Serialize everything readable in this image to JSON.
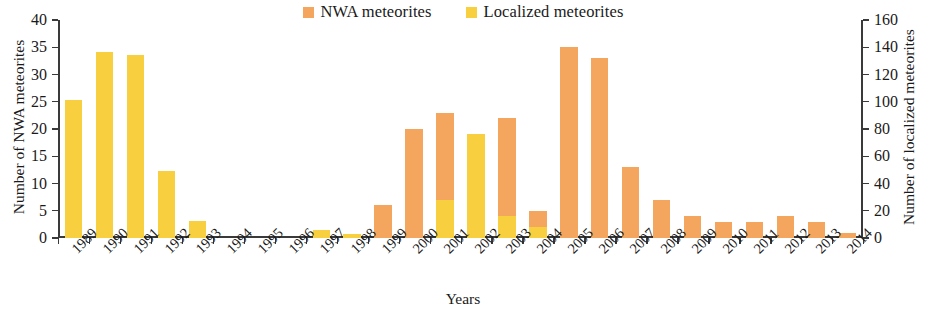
{
  "chart_data": {
    "type": "bar",
    "stacked": true,
    "title": "",
    "xlabel": "Years",
    "ylabel": "Number of NWA meteorites",
    "ylabel_secondary": "Number of localized meteorites",
    "ylim": [
      0,
      40
    ],
    "ylim_secondary": [
      0,
      160
    ],
    "yticks": [
      0,
      5,
      10,
      15,
      20,
      25,
      30,
      35,
      40
    ],
    "yticks_secondary": [
      0,
      20,
      40,
      60,
      80,
      100,
      120,
      140,
      160
    ],
    "grid": false,
    "legend_position": "top-center",
    "categories": [
      "1989",
      "1990",
      "1991",
      "1992",
      "1993",
      "1994",
      "1995",
      "1996",
      "1997",
      "1998",
      "1999",
      "2000",
      "2001",
      "2002",
      "2003",
      "2004",
      "2005",
      "2006",
      "2007",
      "2008",
      "2009",
      "2010",
      "2011",
      "2012",
      "2013",
      "2014"
    ],
    "series": [
      {
        "name": "NWA meteorites",
        "color": "#F5A65E",
        "axis": "left",
        "values": [
          0,
          0,
          0,
          0,
          0,
          0,
          0,
          0,
          0,
          0,
          6,
          20,
          16,
          0,
          18,
          3,
          35,
          33,
          13,
          7,
          4,
          3,
          3,
          4,
          3,
          1
        ]
      },
      {
        "name": "Localized meteorites",
        "color": "#F7CF3F",
        "axis": "right",
        "values_right_scale": [
          101,
          136,
          134,
          49,
          12,
          0,
          0,
          0,
          6,
          3,
          0,
          0,
          28,
          76,
          16,
          8,
          0,
          0,
          0,
          0,
          0,
          0,
          0,
          0,
          0,
          0
        ],
        "values_left_equivalent": [
          25.3,
          34.1,
          33.5,
          12.3,
          3.1,
          0,
          0,
          0,
          1.5,
          0.8,
          0,
          0,
          7.0,
          19.0,
          4.0,
          2.0,
          0,
          0,
          0,
          0,
          0,
          0,
          0,
          0,
          0,
          0
        ]
      }
    ]
  },
  "legend": {
    "entries": [
      {
        "label": "NWA meteorites",
        "color": "#F5A65E"
      },
      {
        "label": "Localized meteorites",
        "color": "#F7CF3F"
      }
    ]
  },
  "axes": {
    "left_title": "Number of NWA meteorites",
    "right_title": "Number of localized meteorites",
    "x_title": "Years"
  }
}
